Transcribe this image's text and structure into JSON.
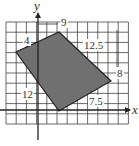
{
  "diagram": {
    "type": "quadrilateral-on-grid",
    "axes": {
      "x_label": "x",
      "y_label": "y"
    },
    "grid": {
      "cols": 12,
      "rows": 10,
      "cell_px": 10.2,
      "left": 6,
      "top": 22,
      "origin_px": [
        38,
        110
      ]
    },
    "shape": {
      "fill": "#707070",
      "stroke": "#222222",
      "vertices_px": [
        [
          59,
          32
        ],
        [
          111,
          81
        ],
        [
          59,
          111
        ],
        [
          16,
          52
        ]
      ]
    },
    "side_labels": [
      {
        "text": "9",
        "x": 61,
        "y": 26
      },
      {
        "text": "12.5",
        "x": 84,
        "y": 49
      },
      {
        "text": "8",
        "x": 117,
        "y": 77
      },
      {
        "text": "7.5",
        "x": 89,
        "y": 105
      },
      {
        "text": "12",
        "x": 22,
        "y": 98
      },
      {
        "text": "4",
        "x": 24,
        "y": 44
      }
    ]
  }
}
